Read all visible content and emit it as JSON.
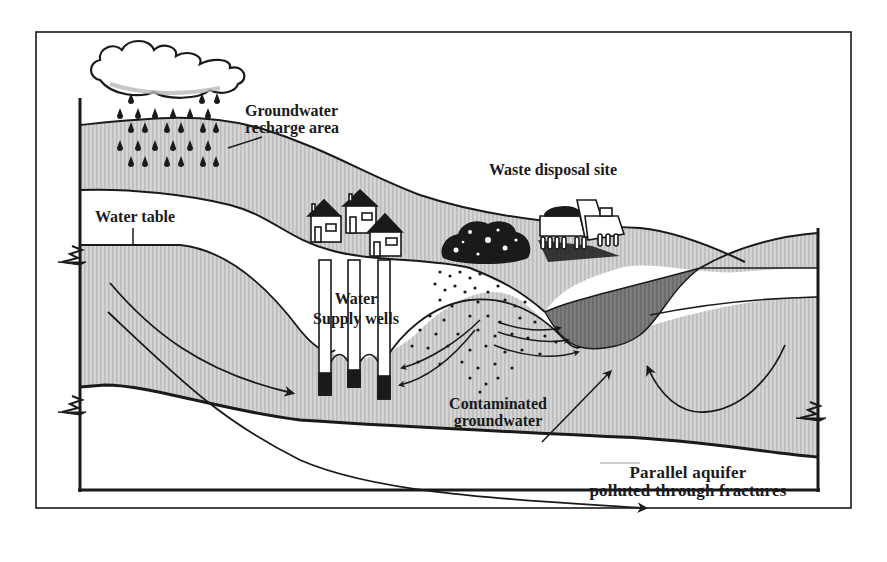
{
  "figure": {
    "labels": {
      "recharge": {
        "line1": "Groundwater",
        "line2": "recharge area"
      },
      "waste_site": "Waste disposal site",
      "water_table": "Water table",
      "wells": {
        "line1": "Water",
        "line2": "Supply wells"
      },
      "contaminated": {
        "line1": "Contaminated",
        "line2": "groundwater"
      },
      "parallel_aquifer": {
        "line1": "Parallel aquifer",
        "line2": "polluted through fractures"
      }
    },
    "elements": {
      "cloud": "rain-cloud-icon",
      "rain": "raindrop-icon",
      "houses": [
        "house-icon",
        "house-icon",
        "house-icon"
      ],
      "waste_pile": "waste-pile-icon",
      "dump_truck": "dump-truck-icon",
      "wells_count": 3,
      "plume": "contaminant-plume",
      "leachate_lens": "leachate-lens"
    },
    "colors": {
      "ink": "#1a1a1a",
      "soil_fill": "#c9c9c9",
      "aquifer_fill": "#cfcfcf",
      "leachate_fill": "#7a7a7a",
      "paper": "#ffffff"
    }
  }
}
